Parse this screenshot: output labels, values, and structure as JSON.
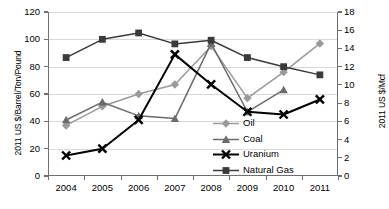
{
  "chart_data": {
    "type": "line",
    "title": "",
    "xlabel": "",
    "ylabel": "2011 US $/Barrel/Ton/Pound",
    "y2label": "2011 US $/Mcf",
    "categories": [
      "2004",
      "2005",
      "2006",
      "2007",
      "2008",
      "2009",
      "2010",
      "2011"
    ],
    "ylim": [
      0,
      120
    ],
    "yticks": [
      "0",
      "20",
      "40",
      "60",
      "80",
      "100",
      "120"
    ],
    "y2lim": [
      0,
      18
    ],
    "y2ticks": [
      "0",
      "2",
      "4",
      "6",
      "8",
      "10",
      "12",
      "14",
      "16",
      "18"
    ],
    "grid": true,
    "legend_position": "inside-lower-center-right",
    "series": [
      {
        "name": "Oil",
        "axis": "left",
        "marker": "diamond",
        "color": "#9a9a9a",
        "values": [
          37,
          51,
          60,
          67,
          95,
          57,
          76,
          97
        ]
      },
      {
        "name": "Coal",
        "axis": "left",
        "marker": "triangle",
        "color": "#6b6b6b",
        "values": [
          41,
          54,
          44,
          42,
          97,
          47,
          63,
          null
        ]
      },
      {
        "name": "Uranium",
        "axis": "left",
        "marker": "x",
        "color": "#000000",
        "values": [
          15,
          20,
          41,
          89,
          67,
          47,
          45,
          56
        ]
      },
      {
        "name": "Natural Gas",
        "axis": "right",
        "marker": "square",
        "color": "#3a3a3a",
        "values": [
          13.0,
          15.0,
          15.7,
          14.5,
          14.9,
          13.0,
          12.0,
          11.1
        ]
      }
    ]
  },
  "colors": {
    "oil": "#9a9a9a",
    "coal": "#6b6b6b",
    "uranium": "#000000",
    "natural_gas": "#3a3a3a",
    "grid": "#d8d8d8",
    "axis": "#6f6f6f",
    "background": "#ffffff"
  },
  "legend": {
    "items": [
      {
        "label": "Oil"
      },
      {
        "label": "Coal"
      },
      {
        "label": "Uranium"
      },
      {
        "label": "Natural Gas"
      }
    ]
  }
}
